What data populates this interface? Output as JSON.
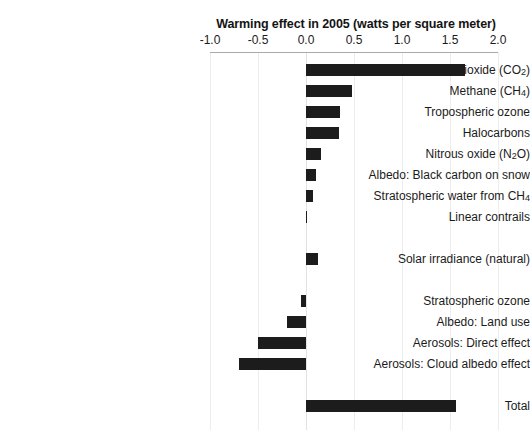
{
  "chart_data": {
    "type": "bar",
    "orientation": "horizontal",
    "title": "Warming effect in 2005 (watts per square meter)",
    "xlabel": "",
    "ylabel": "",
    "xlim": [
      -1.0,
      2.0
    ],
    "xticks": [
      "-1.0",
      "-0.5",
      "0.0",
      "0.5",
      "1.0",
      "1.5",
      "2.0"
    ],
    "xtick_values": [
      -1.0,
      -0.5,
      0.0,
      0.5,
      1.0,
      1.5,
      2.0
    ],
    "grid": true,
    "grid_axis": "x",
    "legend": "none",
    "bar_color": "#1c1c1c",
    "categories": [
      "Carbon dioxide (CO2)",
      "Methane (CH4)",
      "Tropospheric ozone",
      "Halocarbons",
      "Nitrous oxide (N2O)",
      "Albedo:  Black carbon on snow",
      "Stratospheric water from CH4",
      "Linear contrails",
      "Solar irradiance (natural)",
      "Stratospheric ozone",
      "Albedo: Land use",
      "Aerosols:  Direct effect",
      "Aerosols:  Cloud albedo effect",
      "Total"
    ],
    "values": [
      1.66,
      0.48,
      0.35,
      0.34,
      0.16,
      0.1,
      0.07,
      0.01,
      0.12,
      -0.05,
      -0.2,
      -0.5,
      -0.7,
      1.56
    ],
    "rows": [
      {
        "id": "carbon-dioxide",
        "label_html": "Carbon dioxide (CO<sub>2</sub>)",
        "label": "Carbon dioxide (CO2)",
        "value": 1.66,
        "y": 64
      },
      {
        "id": "methane",
        "label_html": "Methane (CH<sub>4</sub>)",
        "label": "Methane (CH4)",
        "value": 0.48,
        "y": 85
      },
      {
        "id": "tropospheric-ozone",
        "label_html": "Tropospheric ozone",
        "label": "Tropospheric ozone",
        "value": 0.35,
        "y": 106
      },
      {
        "id": "halocarbons",
        "label_html": "Halocarbons",
        "label": "Halocarbons",
        "value": 0.34,
        "y": 127
      },
      {
        "id": "nitrous-oxide",
        "label_html": "Nitrous oxide (N<sub>2</sub>O)",
        "label": "Nitrous oxide (N2O)",
        "value": 0.16,
        "y": 148
      },
      {
        "id": "albedo-black-carbon-on-snow",
        "label_html": "Albedo:  Black carbon on snow",
        "label": "Albedo:  Black carbon on snow",
        "value": 0.1,
        "y": 169
      },
      {
        "id": "stratospheric-water",
        "label_html": "Stratospheric water from CH<sub>4</sub>",
        "label": "Stratospheric water from CH4",
        "value": 0.07,
        "y": 190
      },
      {
        "id": "linear-contrails",
        "label_html": "Linear contrails",
        "label": "Linear contrails",
        "value": 0.01,
        "y": 211
      },
      {
        "id": "solar-irradiance",
        "label_html": "Solar irradiance (natural)",
        "label": "Solar irradiance (natural)",
        "value": 0.12,
        "y": 253
      },
      {
        "id": "stratospheric-ozone",
        "label_html": "Stratospheric ozone",
        "label": "Stratospheric ozone",
        "value": -0.05,
        "y": 295
      },
      {
        "id": "albedo-land-use",
        "label_html": "Albedo: Land use",
        "label": "Albedo: Land use",
        "value": -0.2,
        "y": 316
      },
      {
        "id": "aerosols-direct-effect",
        "label_html": "Aerosols:  Direct effect",
        "label": "Aerosols:  Direct effect",
        "value": -0.5,
        "y": 337
      },
      {
        "id": "aerosols-cloud-albedo-effect",
        "label_html": "Aerosols:  Cloud albedo effect",
        "label": "Aerosols:  Cloud albedo effect",
        "value": -0.7,
        "y": 358
      },
      {
        "id": "total",
        "label_html": "Total",
        "label": "Total",
        "value": 1.56,
        "y": 400
      }
    ]
  }
}
